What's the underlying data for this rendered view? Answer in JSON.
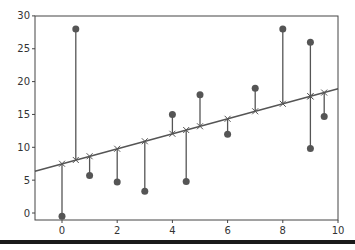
{
  "chart_data": {
    "type": "scatter",
    "title": "",
    "xlabel": "",
    "ylabel": "",
    "xlim": [
      -1,
      10
    ],
    "ylim": [
      -1,
      30
    ],
    "grid": false,
    "legend": null,
    "xticks": [
      0,
      2,
      4,
      6,
      8,
      10
    ],
    "yticks": [
      0,
      5,
      10,
      15,
      20,
      25,
      30
    ],
    "xtick_labels": [
      "0",
      "2",
      "4",
      "6",
      "8",
      "10"
    ],
    "ytick_labels": [
      "0",
      "5",
      "10",
      "15",
      "20",
      "25",
      "30"
    ],
    "series": [
      {
        "name": "observed",
        "marker": "circle",
        "color": "#555555",
        "points": [
          {
            "x": 0,
            "y": -0.5
          },
          {
            "x": 0.5,
            "y": 28
          },
          {
            "x": 1,
            "y": 5.7
          },
          {
            "x": 2,
            "y": 4.7
          },
          {
            "x": 3,
            "y": 3.3
          },
          {
            "x": 4,
            "y": 15
          },
          {
            "x": 4.5,
            "y": 4.8
          },
          {
            "x": 5,
            "y": 18
          },
          {
            "x": 6,
            "y": 12
          },
          {
            "x": 7,
            "y": 19
          },
          {
            "x": 8,
            "y": 28
          },
          {
            "x": 9,
            "y": 26
          },
          {
            "x": 9,
            "y": 9.8
          },
          {
            "x": 9.5,
            "y": 14.7
          }
        ]
      },
      {
        "name": "fitted",
        "marker": "x",
        "color": "#555555",
        "type": "line",
        "slope": 1.14,
        "intercept": 7.5
      }
    ],
    "residual_lines": true
  }
}
